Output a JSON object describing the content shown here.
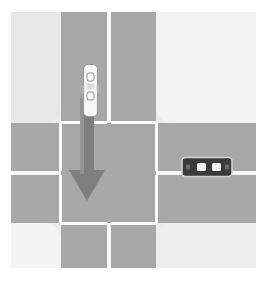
{
  "scene": {
    "title": "four-way-intersection-top-down",
    "description": "Top-down road intersection diagram with two vehicles and a straight-through movement arrow",
    "background_color": "#ffffff",
    "road_color": "#a8a8a8",
    "lane_marking_color": "#fbfbfb",
    "block_color": "#e8e8e8"
  },
  "roads": {
    "vertical": {
      "name": "vertical-road",
      "orientation": "north-south"
    },
    "horizontal": {
      "name": "horizontal-road",
      "orientation": "east-west"
    }
  },
  "blocks": [
    {
      "name": "top-left-block",
      "color": "#e8e8e8"
    },
    {
      "name": "top-right-block",
      "color": "#f2f2f2"
    },
    {
      "name": "bottom-left-block",
      "color": "#f4f4f4"
    },
    {
      "name": "bottom-right-block",
      "color": "#eeeeee"
    }
  ],
  "lane_markings": [
    {
      "name": "vertical-centerline-north"
    },
    {
      "name": "vertical-centerline-south"
    },
    {
      "name": "horizontal-centerline-west"
    },
    {
      "name": "horizontal-centerline-east"
    },
    {
      "name": "stop-line-north-left"
    },
    {
      "name": "stop-line-north-right"
    },
    {
      "name": "stop-line-south-left"
    },
    {
      "name": "stop-line-south-right"
    },
    {
      "name": "edge-line-west-upper"
    },
    {
      "name": "edge-line-west-lower"
    },
    {
      "name": "edge-line-east-upper"
    },
    {
      "name": "edge-line-east-lower"
    }
  ],
  "vehicles": [
    {
      "name": "white-car",
      "color": "#f7f7f7",
      "outline_color": "#8c8c8c",
      "heading": "south",
      "lane": "vertical-road-southbound",
      "windows": 2
    },
    {
      "name": "dark-car",
      "color": "#3a3a3a",
      "outline_color": "#cfcfcf",
      "heading": "west",
      "lane": "horizontal-road-westbound",
      "windows": 2
    }
  ],
  "arrow": {
    "name": "movement-arrow",
    "color": "#7e7e7e",
    "direction": "south",
    "maneuver": "straight-through",
    "belongs_to": "white-car"
  }
}
